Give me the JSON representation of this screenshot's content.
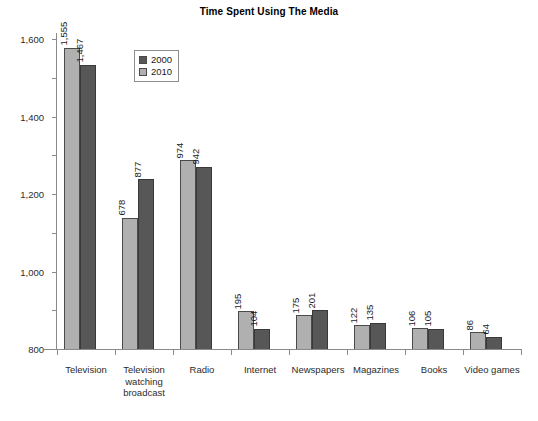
{
  "chart_data": {
    "type": "bar",
    "title": "Time Spent Using The Media",
    "xlabel": "",
    "ylabel": "",
    "ylim": [
      0,
      1600
    ],
    "yticks": [
      "0",
      "200",
      "400",
      "600",
      "800",
      "1,000",
      "1,200",
      "1,400",
      "1,600"
    ],
    "ytick_values": [
      0,
      200,
      400,
      600,
      800,
      1000,
      1200,
      1400,
      1600
    ],
    "grid": false,
    "legend_position": "upper-left-inset",
    "categories": [
      "Television",
      "Television watching broadcast",
      "Radio",
      "Internet",
      "Newspapers",
      "Magazines",
      "Books",
      "Video games"
    ],
    "series": [
      {
        "name": "2010",
        "color": "#b0b0b0",
        "values": [
          1555,
          678,
          974,
          195,
          175,
          122,
          106,
          86
        ],
        "labels": [
          "1,555",
          "678",
          "974",
          "195",
          "175",
          "122",
          "106",
          "86"
        ]
      },
      {
        "name": "2000",
        "color": "#575757",
        "values": [
          1467,
          877,
          942,
          104,
          201,
          135,
          105,
          64
        ],
        "labels": [
          "1,467",
          "877",
          "942",
          "104",
          "201",
          "135",
          "105",
          "64"
        ]
      }
    ]
  },
  "legend": {
    "entries": [
      {
        "label": "2000",
        "swatch": "s2000"
      },
      {
        "label": "2010",
        "swatch": "s2010"
      }
    ]
  },
  "category_lines": [
    [
      "Television"
    ],
    [
      "Television",
      "watching",
      "broadcast"
    ],
    [
      "Radio"
    ],
    [
      "Internet"
    ],
    [
      "Newspapers"
    ],
    [
      "Magazines"
    ],
    [
      "Books"
    ],
    [
      "Video games"
    ]
  ],
  "colors": {
    "series_2000": "#575757",
    "series_2010": "#b0b0b0",
    "axis": "#8a8a8a",
    "text": "#1a1a1a",
    "background": "#ffffff"
  }
}
